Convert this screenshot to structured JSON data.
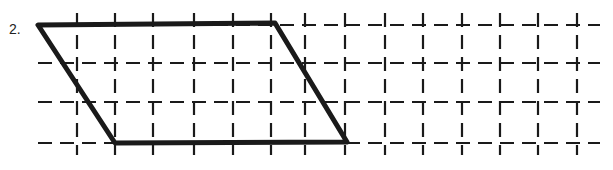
{
  "problem": {
    "number_label": "2.",
    "description": "Parallelogram drawn on dashed square grid",
    "colors": {
      "lines": "#1a1a1a",
      "background": "#ffffff"
    }
  },
  "grid": {
    "columns_x": [
      77,
      115,
      153,
      194,
      233,
      271,
      305,
      345,
      385,
      423,
      462,
      500,
      538,
      577
    ],
    "rows_y": [
      25,
      63,
      102,
      143
    ],
    "x_start": 38,
    "x_end": 600
  },
  "parallelogram": {
    "vertices": [
      [
        38,
        25
      ],
      [
        275,
        23
      ],
      [
        347,
        142
      ],
      [
        115,
        143
      ]
    ]
  }
}
